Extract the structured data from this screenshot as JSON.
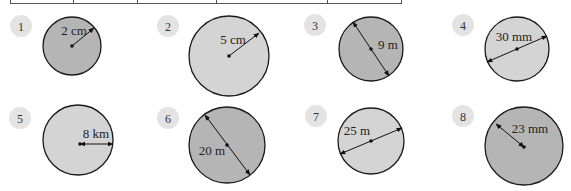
{
  "table_fragment": {
    "columns_x": [
      10,
      73,
      137,
      216,
      327,
      402
    ],
    "bottom_y": 3
  },
  "colors": {
    "dark_fill": "#b5b5b5",
    "light_fill": "#d4d4d4",
    "outline": "#1a1a1a",
    "badge_fill": "#e3e3e3"
  },
  "problems": [
    {
      "number": "1",
      "label": "2 cm",
      "measure": "radius",
      "value": 2,
      "unit": "cm",
      "shade": "dark"
    },
    {
      "number": "2",
      "label": "5 cm",
      "measure": "radius",
      "value": 5,
      "unit": "cm",
      "shade": "light"
    },
    {
      "number": "3",
      "label": "9 m",
      "measure": "diameter",
      "value": 9,
      "unit": "m",
      "shade": "dark"
    },
    {
      "number": "4",
      "label": "30 mm",
      "measure": "diameter",
      "value": 30,
      "unit": "mm",
      "shade": "light"
    },
    {
      "number": "5",
      "label": "8 km",
      "measure": "radius",
      "value": 8,
      "unit": "km",
      "shade": "light"
    },
    {
      "number": "6",
      "label": "20 m",
      "measure": "diameter",
      "value": 20,
      "unit": "m",
      "shade": "dark"
    },
    {
      "number": "7",
      "label": "25 m",
      "measure": "diameter",
      "value": 25,
      "unit": "m",
      "shade": "light"
    },
    {
      "number": "8",
      "label": "23 mm",
      "measure": "radius",
      "value": 23,
      "unit": "mm",
      "shade": "dark"
    }
  ]
}
